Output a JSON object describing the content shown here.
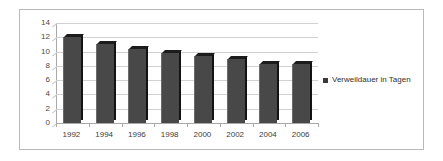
{
  "chart_data": {
    "type": "bar",
    "title": "",
    "subtitle": "",
    "xlabel": "",
    "ylabel": "",
    "categories": [
      "1992",
      "1994",
      "1996",
      "1998",
      "2000",
      "2002",
      "2004",
      "2006"
    ],
    "values": [
      12.0,
      11.1,
      10.4,
      9.8,
      9.4,
      9.0,
      8.3,
      8.2
    ],
    "series": [
      {
        "name": "Verweildauer in Tagen",
        "values": [
          12.0,
          11.1,
          10.4,
          9.8,
          9.4,
          9.0,
          8.3,
          8.2
        ]
      }
    ],
    "ylim": [
      0,
      14
    ],
    "y_ticks": [
      0,
      2,
      4,
      6,
      8,
      10,
      12,
      14
    ],
    "y_tick_labels": [
      "0",
      "2",
      "4",
      "6",
      "8",
      "10",
      "12",
      "14"
    ],
    "grid": true,
    "grid_axis": "y",
    "legend": [
      "Verweildauer in Tagen"
    ],
    "legend_position": "right",
    "annotations": [],
    "style": "3d-column"
  },
  "legend": {
    "entry_label": "Verweildauer in Tagen",
    "swatch_color": "#3a3a3a"
  },
  "colors": {
    "bar_front": "#484848",
    "bar_side": "#131313",
    "bar_top": "#1c1c1c",
    "gridline": "#d2d2d2",
    "axis": "#a8a8a8",
    "frame_border": "#b9b9b9",
    "background": "#ffffff",
    "tick_text": "#3d3d3d"
  }
}
